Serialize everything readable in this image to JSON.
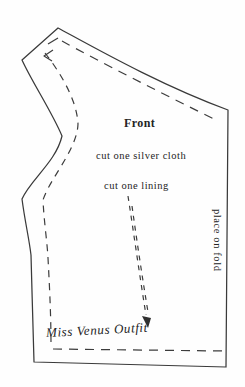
{
  "labels": {
    "piece_name": "Front",
    "cut_instruction_cloth": "cut one silver cloth",
    "cut_instruction_lining": "cut one lining",
    "fold_instruction": "place on fold",
    "outfit_name": "Miss Venus Outfit"
  },
  "colors": {
    "background": "#fefefe",
    "outline": "#3a3a3a",
    "dashed_line": "#3c3c3c",
    "text": "#242424"
  }
}
